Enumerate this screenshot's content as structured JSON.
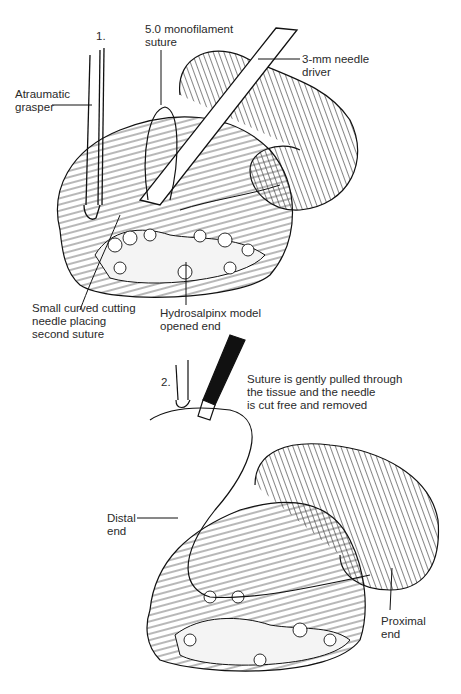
{
  "panel1": {
    "step": "1.",
    "labels": {
      "grasper": "Atraumatic\ngrasper",
      "suture": "5.0 monofilament\nsuture",
      "driver": "3-mm needle\ndriver",
      "needle": "Small curved cutting\nneedle placing\nsecond suture",
      "model": "Hydrosalpinx model\nopened end"
    }
  },
  "panel2": {
    "step": "2.",
    "labels": {
      "caption": "Suture is gently pulled through\nthe tissue and the needle\nis cut free and removed",
      "distal": "Distal\nend",
      "proximal": "Proximal\nend"
    }
  },
  "colors": {
    "ink": "#1a1a1a",
    "background": "#ffffff"
  }
}
